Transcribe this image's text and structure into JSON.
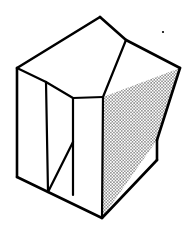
{
  "figure": {
    "type": "technical-line-drawing",
    "projection": "isometric",
    "canvas": {
      "width": 193,
      "height": 237,
      "background": "#ffffff"
    },
    "stroke": {
      "color": "#000000",
      "outer_width": 2.6,
      "inner_width": 2.2
    },
    "colors": {
      "ink": "#000000",
      "paper": "#ffffff",
      "stipple_dot": "#000000",
      "plain_face_fill": "#ffffff"
    },
    "stipple": {
      "pattern": "regular-dot-grid",
      "spacing_px": 3.1,
      "dot_radius_px": 0.62,
      "applied_to": "front-right-triangular-face"
    },
    "vertices": {
      "A_top_apex": [
        100,
        17
      ],
      "B_left_top_back": [
        17,
        68
      ],
      "C_left_top_front": [
        46,
        82
      ],
      "D_ridge_notch": [
        126,
        40
      ],
      "E_inner_valley": [
        103,
        97
      ],
      "F_right_top_outer": [
        180,
        68
      ],
      "G_mid_top_front": [
        73,
        98
      ],
      "H_left_bottom_back": [
        17,
        177
      ],
      "I_left_bottom_front": [
        48,
        192
      ],
      "J_mid_bottom_front": [
        73,
        142
      ],
      "K_bottom_apex": [
        102,
        218
      ],
      "L_right_lower_corner": [
        157,
        160
      ],
      "M_right_edge_bend": [
        157,
        140
      ],
      "N_inner_bottom": [
        73,
        195
      ]
    },
    "faces": [
      {
        "name": "left-slab-top-face",
        "shading": "plain",
        "points": "17,68 100,17 126,40 46,82"
      },
      {
        "name": "left-slab-front-face",
        "shading": "plain",
        "points": "17,68 46,82 48,192 17,177"
      },
      {
        "name": "left-slab-side-face",
        "shading": "plain",
        "points": "46,82 73,98 73,195 48,192"
      },
      {
        "name": "inner-notch-face",
        "shading": "plain",
        "points": "126,40 103,97 73,98 100,17"
      },
      {
        "name": "right-slab-top-face",
        "shading": "plain",
        "points": "103,97 126,40 180,68 157,140"
      },
      {
        "name": "front-right-triangular-face",
        "shading": "stipple",
        "points": "103,97 180,68 157,140 102,218"
      }
    ],
    "edges": [
      {
        "name": "edge-outer-top-left",
        "path": "M17,68 L100,17",
        "weight": "outer"
      },
      {
        "name": "edge-outer-top-right",
        "path": "M100,17 L126,40",
        "weight": "outer"
      },
      {
        "name": "edge-ridge-to-right-corner",
        "path": "M126,40 L180,68",
        "weight": "outer"
      },
      {
        "name": "edge-right-outer-descent",
        "path": "M180,68 L157,140",
        "weight": "outer"
      },
      {
        "name": "edge-right-vertical-lower",
        "path": "M157,140 L157,160",
        "weight": "outer"
      },
      {
        "name": "edge-bottom-right-return",
        "path": "M157,160 L102,218",
        "weight": "outer"
      },
      {
        "name": "edge-bottom-main",
        "path": "M102,218 L17,177",
        "weight": "outer"
      },
      {
        "name": "edge-left-vertical-outer",
        "path": "M17,68 L17,177",
        "weight": "outer"
      },
      {
        "name": "edge-left-front-vertical",
        "path": "M46,82 L48,192",
        "weight": "inner"
      },
      {
        "name": "edge-left-top-to-front",
        "path": "M17,68 L46,82",
        "weight": "inner"
      },
      {
        "name": "edge-front-top-run",
        "path": "M46,82 L73,98",
        "weight": "inner"
      },
      {
        "name": "edge-mid-front-vertical",
        "path": "M73,98 L73,195",
        "weight": "inner"
      },
      {
        "name": "edge-notch-diagonal",
        "path": "M126,40 L103,97",
        "weight": "inner"
      },
      {
        "name": "edge-valley-to-mid",
        "path": "M103,97 L73,98",
        "weight": "inner"
      },
      {
        "name": "edge-stipple-left-vertical",
        "path": "M103,97 L102,218",
        "weight": "inner"
      },
      {
        "name": "edge-inner-diagonal-lower",
        "path": "M73,142 L48,192",
        "weight": "inner"
      }
    ],
    "marks": [
      {
        "name": "ink-speck",
        "cx": 163,
        "cy": 32,
        "r": 1.1
      }
    ]
  }
}
